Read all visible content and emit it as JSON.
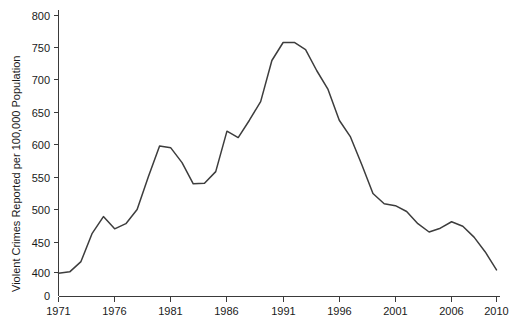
{
  "chart_data": {
    "type": "line",
    "title": "",
    "xlabel": "",
    "ylabel": "Violent Crimes Reported per 100,000 Population",
    "xlim": [
      1971,
      2010
    ],
    "ylim": [
      400,
      800
    ],
    "y_axis_break": true,
    "y_zero_label": "0",
    "grid": false,
    "legend": "none",
    "xticks": [
      1971,
      1976,
      1981,
      1986,
      1991,
      1996,
      2001,
      2006,
      2010
    ],
    "xtick_labels": [
      "1971",
      "1976",
      "1981",
      "1986",
      "1991",
      "1996",
      "2001",
      "2006",
      "2010"
    ],
    "yticks": [
      400,
      450,
      500,
      550,
      600,
      650,
      700,
      750,
      800
    ],
    "ytick_labels": [
      "400",
      "450",
      "500",
      "550",
      "600",
      "650",
      "700",
      "750",
      "800"
    ],
    "series": [
      {
        "name": "Violent crime rate",
        "x": [
          1971,
          1972,
          1973,
          1974,
          1975,
          1976,
          1977,
          1978,
          1979,
          1980,
          1981,
          1982,
          1983,
          1984,
          1985,
          1986,
          1987,
          1988,
          1989,
          1990,
          1991,
          1992,
          1993,
          1994,
          1995,
          1996,
          1997,
          1998,
          1999,
          2000,
          2001,
          2002,
          2003,
          2004,
          2005,
          2006,
          2007,
          2008,
          2009,
          2010
        ],
        "values": [
          399,
          401,
          417,
          461,
          487,
          468,
          476,
          498,
          549,
          597,
          594,
          571,
          538,
          539,
          557,
          620,
          610,
          637,
          666,
          730,
          758,
          758,
          747,
          714,
          685,
          637,
          611,
          568,
          523,
          507,
          504,
          495,
          476,
          463,
          469,
          479,
          472,
          455,
          432,
          404
        ]
      }
    ]
  },
  "axes": {
    "y_title": "Violent Crimes Reported per 100,000 Population"
  }
}
